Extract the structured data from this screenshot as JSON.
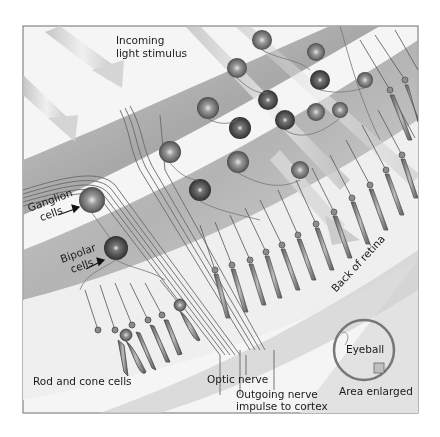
{
  "figure": {
    "colors": {
      "frame": "#6e6e6e",
      "background": "#f4f4f4",
      "band": "#b9b9b9",
      "band_light": "#dcdcdc",
      "cell_dark": "#555555",
      "cell_mid": "#8c8c8c",
      "nerve": "#707070",
      "text": "#1a1a1a"
    }
  },
  "labels": {
    "incoming_light_line1": "Incoming",
    "incoming_light_line2": "light stimulus",
    "ganglion_line1": "Ganglion",
    "ganglion_line2": "cells",
    "bipolar_line1": "Bipolar",
    "bipolar_line2": "cells",
    "rod_cone": "Rod and cone cells",
    "optic_nerve": "Optic nerve",
    "outgoing_line1": "Outgoing nerve",
    "outgoing_line2": "impulse to cortex",
    "back_of_retina": "Back of retina",
    "eyeball": "Eyeball",
    "area_enlarged": "Area enlarged"
  }
}
